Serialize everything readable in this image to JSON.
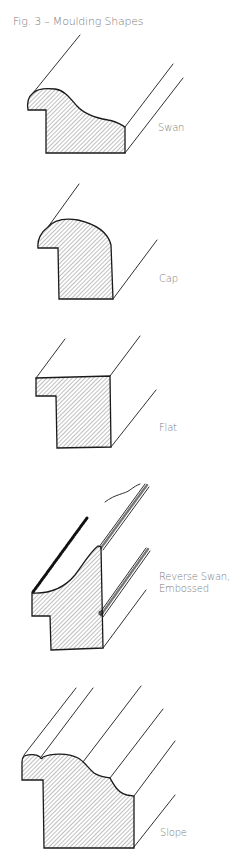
{
  "figure": {
    "title": "Fig. 3 – Moulding Shapes",
    "shapes": [
      {
        "name": "Swan",
        "label": "Swan"
      },
      {
        "name": "Cap",
        "label": "Cap"
      },
      {
        "name": "Flat",
        "label": "Flat"
      },
      {
        "name": "Reverse Swan, Embossed",
        "label_line1": "Reverse Swan,",
        "label_line2": "Embossed"
      },
      {
        "name": "Slope",
        "label": "Slope"
      }
    ]
  },
  "colors": {
    "stroke": "#1a1a1a",
    "hatch": "#8a8a8a",
    "text": "#7d7d7d",
    "background": "#ffffff"
  }
}
